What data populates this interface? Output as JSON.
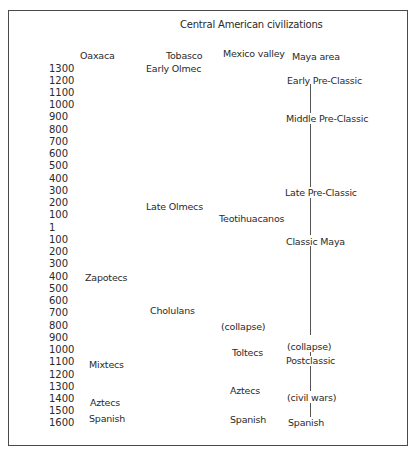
{
  "title": "Central American civilizations",
  "columns": {
    "oaxaca": "Oaxaca",
    "tobasco": "Tobasco",
    "mexico_valley": "Mexico valley",
    "maya_area": "Maya area"
  },
  "years": [
    "1300",
    "1200",
    "1100",
    "1000",
    "900",
    "800",
    "700",
    "600",
    "500",
    "400",
    "300",
    "200",
    "100",
    "1",
    "100",
    "200",
    "300",
    "400",
    "500",
    "600",
    "700",
    "800",
    "900",
    "1000",
    "1100",
    "1200",
    "1300",
    "1400",
    "1500",
    "1600"
  ],
  "oaxaca": {
    "zapotecs": "Zapotecs",
    "mixtecs": "Mixtecs",
    "aztecs": "Aztecs",
    "spanish": "Spanish"
  },
  "tobasco": {
    "early_olmec": "Early Olmec",
    "late_olmecs": "Late Olmecs",
    "cholulans": "Cholulans"
  },
  "mexico_valley": {
    "teotihuacanos": "Teotihuacanos",
    "collapse": "(collapse)",
    "toltecs": "Toltecs",
    "aztecs": "Aztecs",
    "spanish": "Spanish"
  },
  "maya_area": {
    "early_pre_classic": "Early Pre-Classic",
    "middle_pre_classic": "Middle Pre-Classic",
    "late_pre_classic": "Late Pre-Classic",
    "classic_maya": "Classic Maya",
    "collapse": "(collapse)",
    "postclassic": "Postclassic",
    "civil_wars": "(civil wars)",
    "spanish": "Spanish"
  }
}
